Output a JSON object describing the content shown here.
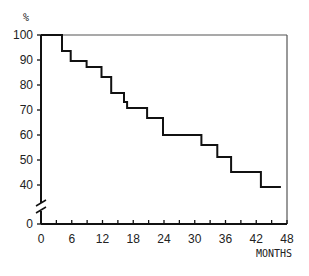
{
  "chart_data": {
    "type": "line",
    "step": true,
    "title": "",
    "xlabel": "MONTHS",
    "ylabel": "%",
    "xlim": [
      0,
      48
    ],
    "ylim": [
      0,
      100
    ],
    "axis_break": {
      "axis": "y",
      "between": [
        0,
        40
      ]
    },
    "x_ticks": [
      0,
      6,
      12,
      18,
      24,
      30,
      36,
      42,
      48
    ],
    "x_minor_ticks": [
      3,
      9,
      15,
      21,
      27,
      33,
      39,
      45
    ],
    "y_ticks": [
      0,
      40,
      50,
      60,
      70,
      80,
      90,
      100
    ],
    "grid": false,
    "legend": null,
    "series": [
      {
        "name": "Survival",
        "x": [
          0,
          4.1,
          5.8,
          8.9,
          11.8,
          13.7,
          16.2,
          16.8,
          20.7,
          23.8,
          31.3,
          34.4,
          37.1,
          42.9,
          46.8
        ],
        "y": [
          100,
          93.6,
          89.6,
          87.2,
          83.2,
          76.8,
          73.2,
          70.8,
          66.8,
          60.0,
          56.0,
          51.2,
          45.2,
          39.2,
          39.2
        ]
      }
    ]
  },
  "labels": {
    "y_unit": "%",
    "x_unit": "MONTHS",
    "x_ticks": [
      "0",
      "6",
      "12",
      "18",
      "24",
      "30",
      "36",
      "42",
      "48"
    ],
    "y_ticks": [
      "0",
      "40",
      "50",
      "60",
      "70",
      "80",
      "90",
      "100"
    ]
  },
  "colors": {
    "line": "#111111",
    "axis": "#111111",
    "frame": "#555555",
    "background": "#ffffff"
  }
}
